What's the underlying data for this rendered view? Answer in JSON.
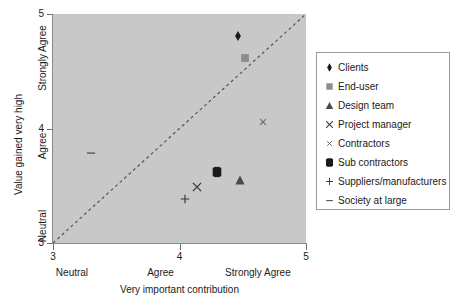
{
  "chart_data": {
    "type": "scatter",
    "title": "",
    "xlabel": "Very important contribution",
    "ylabel": "Value gained very high",
    "xlim": [
      3,
      5
    ],
    "ylim": [
      3,
      5
    ],
    "grid": false,
    "plot_background": "#c8c8c8",
    "legend_position": "right",
    "x_ticks": [
      "3",
      "4",
      "5"
    ],
    "x_tick_values": [
      3,
      4,
      5
    ],
    "y_ticks": [
      "3",
      "4",
      "5"
    ],
    "y_tick_values": [
      3,
      4,
      5
    ],
    "x_category_labels": [
      "Neutral",
      "Agree",
      "Strongly Agree"
    ],
    "y_category_labels": [
      "Neutral",
      "Agree",
      "Strongly Agree"
    ],
    "reference_line": {
      "label": "y = x diagonal",
      "style": "dashed",
      "from": [
        3,
        3
      ],
      "to": [
        5,
        5
      ],
      "color": "#555555"
    },
    "series": [
      {
        "name": "Clients",
        "marker": "diamond",
        "color": "#1a1a1a",
        "x": 4.46,
        "y": 4.81
      },
      {
        "name": "End-user",
        "marker": "square-gray",
        "color": "#8c8c8c",
        "x": 4.52,
        "y": 4.62
      },
      {
        "name": "Design team",
        "marker": "triangle",
        "color": "#4a4a4a",
        "x": 4.48,
        "y": 3.55
      },
      {
        "name": "Project manager",
        "marker": "cross-large",
        "color": "#3a3a3a",
        "x": 4.14,
        "y": 3.49
      },
      {
        "name": "Contractors",
        "marker": "cross-small",
        "color": "#6e6e6e",
        "x": 4.66,
        "y": 4.06
      },
      {
        "name": "Sub contractors",
        "marker": "square-filled",
        "color": "#1a1a1a",
        "x": 4.3,
        "y": 3.62
      },
      {
        "name": "Suppliers/manufacturers",
        "marker": "plus",
        "color": "#3a3a3a",
        "x": 4.04,
        "y": 3.38
      },
      {
        "name": "Society at large",
        "marker": "dash",
        "color": "#5a5a5a",
        "x": 3.3,
        "y": 3.79
      }
    ]
  }
}
